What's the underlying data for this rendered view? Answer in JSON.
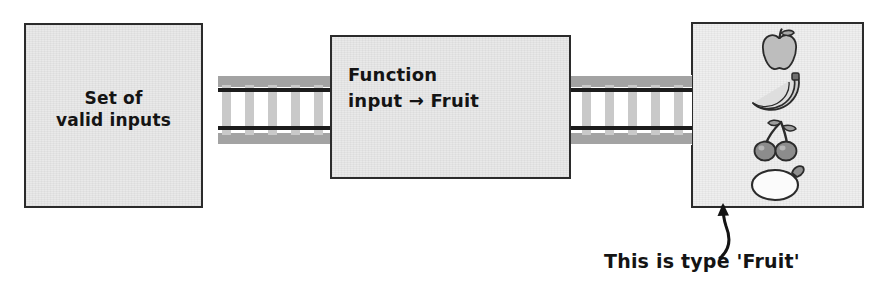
{
  "diagram": {
    "boxes": {
      "inputs": {
        "label": "Set of\nvalid inputs",
        "fill_color": "#e9e9e9",
        "border_color": "#2b2b2b"
      },
      "function": {
        "label": "Function\ninput → Fruit",
        "fill_color": "#e9e9e9",
        "border_color": "#2b2b2b"
      },
      "output": {
        "fill_color": "#efefef",
        "border_color": "#2b2b2b",
        "items": [
          {
            "name": "apple-icon",
            "label": "apple"
          },
          {
            "name": "banana-icon",
            "label": "bananas"
          },
          {
            "name": "cherries-icon",
            "label": "cherries"
          },
          {
            "name": "lemon-icon",
            "label": "lemon"
          }
        ]
      }
    },
    "conveyor": {
      "name": "conveyor-track",
      "rail_color": "#1c1c1c",
      "frame_color": "#9a9a9a",
      "slat_color": "#c6c6c6",
      "segments": [
        "left",
        "right"
      ]
    },
    "annotation": {
      "caption": "This is type 'Fruit'",
      "arrow_name": "callout-arrow",
      "arrow_color": "#141414"
    }
  }
}
